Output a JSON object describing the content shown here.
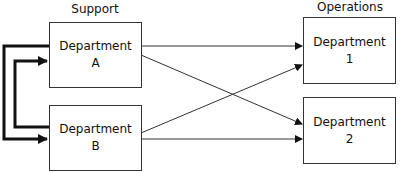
{
  "groups": {
    "support": "Support",
    "operations": "Operations"
  },
  "nodes": {
    "deptA": {
      "line1": "Department",
      "line2": "A"
    },
    "deptB": {
      "line1": "Department",
      "line2": "B"
    },
    "dept1": {
      "line1": "Department",
      "line2": "1"
    },
    "dept2": {
      "line1": "Department",
      "line2": "2"
    }
  },
  "edges": [
    {
      "from": "Department A",
      "to": "Department B",
      "style": "thick"
    },
    {
      "from": "Department B",
      "to": "Department A",
      "style": "thick"
    },
    {
      "from": "Department A",
      "to": "Department 1",
      "style": "thin"
    },
    {
      "from": "Department A",
      "to": "Department 2",
      "style": "thin"
    },
    {
      "from": "Department B",
      "to": "Department 1",
      "style": "thin"
    },
    {
      "from": "Department B",
      "to": "Department 2",
      "style": "thin"
    }
  ]
}
